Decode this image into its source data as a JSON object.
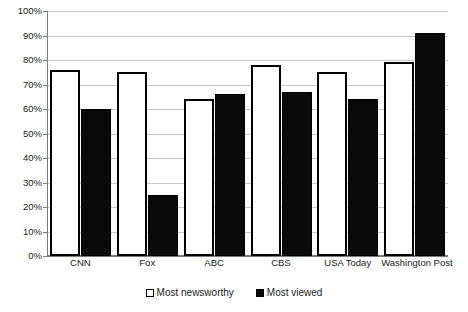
{
  "chart_data": {
    "type": "bar",
    "title": "",
    "subtitle": "",
    "xlabel": "",
    "ylabel": "",
    "ylim": [
      0,
      100
    ],
    "ytick_step": 10,
    "ytick_labels": [
      "0%",
      "10%",
      "20%",
      "30%",
      "40%",
      "50%",
      "60%",
      "70%",
      "80%",
      "90%",
      "100%"
    ],
    "ytick_values": [
      0,
      10,
      20,
      30,
      40,
      50,
      60,
      70,
      80,
      90,
      100
    ],
    "grid": true,
    "legend_position": "bottom-center",
    "categories": [
      "CNN",
      "Fox",
      "ABC",
      "CBS",
      "USA Today",
      "Washington Post"
    ],
    "series": [
      {
        "name": "Most newsworthy",
        "color": "#ffffff",
        "edge_color": "#000000",
        "values": [
          76,
          75,
          64,
          78,
          75,
          79
        ]
      },
      {
        "name": "Most viewed",
        "color": "#000000",
        "edge_color": "#000000",
        "values": [
          60,
          25,
          66,
          67,
          64,
          91
        ]
      }
    ]
  },
  "legend": {
    "items": [
      {
        "label": "Most newsworthy",
        "swatch": "light"
      },
      {
        "label": "Most viewed",
        "swatch": "dark"
      }
    ]
  }
}
